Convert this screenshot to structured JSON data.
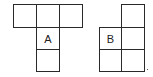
{
  "diagram": {
    "type": "cube-nets",
    "line_color": "#2a2a2a",
    "figures": [
      {
        "id": "A",
        "label": "A",
        "cells": [
          {
            "x": 13,
            "y": 4,
            "w": 24,
            "h": 24,
            "label": ""
          },
          {
            "x": 36,
            "y": 4,
            "w": 24,
            "h": 24,
            "label": ""
          },
          {
            "x": 59,
            "y": 4,
            "w": 24,
            "h": 24,
            "label": ""
          },
          {
            "x": 36,
            "y": 27,
            "w": 24,
            "h": 23,
            "label": "A"
          },
          {
            "x": 36,
            "y": 49,
            "w": 24,
            "h": 23,
            "label": ""
          }
        ]
      },
      {
        "id": "B",
        "label": "B",
        "cells": [
          {
            "x": 121,
            "y": 4,
            "w": 24,
            "h": 24,
            "label": ""
          },
          {
            "x": 99,
            "y": 27,
            "w": 23,
            "h": 23,
            "label": "B"
          },
          {
            "x": 121,
            "y": 27,
            "w": 24,
            "h": 23,
            "label": ""
          },
          {
            "x": 99,
            "y": 49,
            "w": 23,
            "h": 23,
            "label": ""
          },
          {
            "x": 121,
            "y": 49,
            "w": 24,
            "h": 23,
            "label": ""
          }
        ]
      }
    ]
  }
}
